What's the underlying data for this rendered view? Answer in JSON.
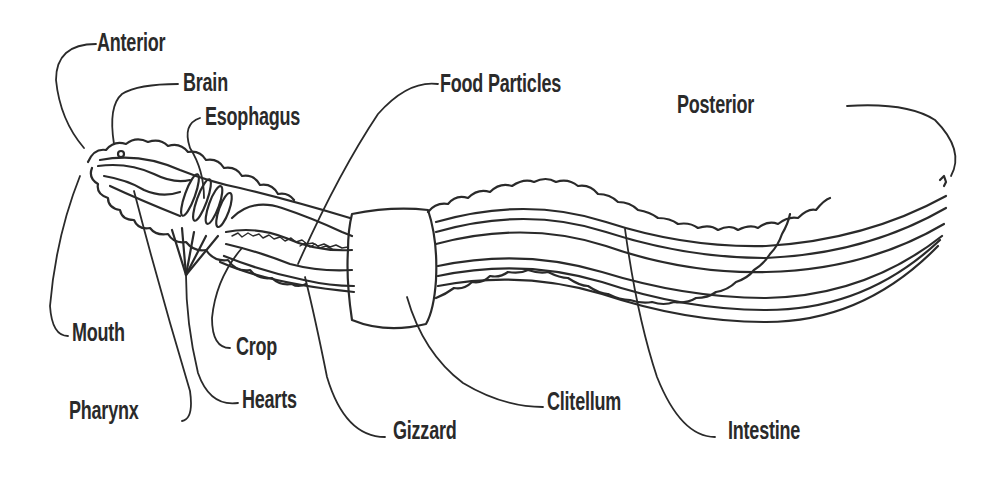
{
  "diagram": {
    "ink_color": "#2a2a2a",
    "background": "#ffffff",
    "labels": {
      "anterior": "Anterior",
      "brain": "Brain",
      "esophagus": "Esophagus",
      "food_particles": "Food Particles",
      "posterior": "Posterior",
      "mouth": "Mouth",
      "crop": "Crop",
      "pharynx": "Pharynx",
      "hearts": "Hearts",
      "gizzard": "Gizzard",
      "clitellum": "Clitellum",
      "intestine": "Intestine"
    }
  }
}
